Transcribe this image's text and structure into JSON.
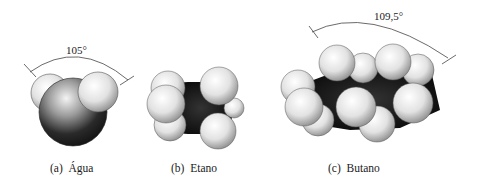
{
  "figure": {
    "panels": [
      {
        "id": "a",
        "caption": "(a)  Água",
        "angle_label": "105°",
        "molecule": "water"
      },
      {
        "id": "b",
        "caption": "(b)  Etano",
        "molecule": "ethane"
      },
      {
        "id": "c",
        "caption": "(c)  Butano",
        "angle_label": "109,5°",
        "molecule": "butane"
      }
    ]
  },
  "colors": {
    "background": "#ffffff",
    "hydrogen": "#e8e8e8",
    "carbon_oxygen": "#111111",
    "line": "#333333"
  }
}
